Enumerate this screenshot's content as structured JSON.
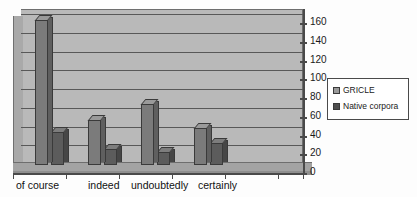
{
  "chart_data": {
    "type": "bar",
    "title": "",
    "subtitle": "",
    "xlabel": "",
    "ylabel": "",
    "categories": [
      "of course",
      "indeed",
      "undoubtedly",
      "certainly"
    ],
    "series": [
      {
        "name": "GRICLE",
        "values": [
          155,
          48,
          65,
          39
        ],
        "color": "#9a9a9a"
      },
      {
        "name": "Native corpora",
        "values": [
          35,
          17,
          14,
          23
        ],
        "color": "#4f4f4f"
      }
    ],
    "ylim": [
      0,
      160
    ],
    "ytick_step": 20,
    "yticks": [
      0,
      20,
      40,
      60,
      80,
      100,
      120,
      140,
      160
    ],
    "ytick_labels": [
      "0",
      "20",
      "40",
      "60",
      "80",
      "100",
      "120",
      "140",
      "160"
    ],
    "grid": true,
    "grid_axis": "y",
    "legend_position": "right",
    "style": "3d-column",
    "background": "#b9b9b9"
  },
  "legend": {
    "entries": [
      {
        "label": "GRICLE",
        "swatch": "legend-swatch-gricle"
      },
      {
        "label": "Native corpora",
        "swatch": "legend-swatch-native-corpora"
      }
    ]
  }
}
